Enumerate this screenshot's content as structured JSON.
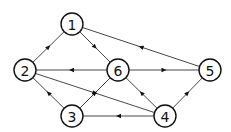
{
  "diagram": {
    "type": "directed-graph",
    "nodes": [
      {
        "id": "1",
        "label": "1",
        "x": 72,
        "y": 24
      },
      {
        "id": "2",
        "label": "2",
        "x": 25,
        "y": 70
      },
      {
        "id": "6",
        "label": "6",
        "x": 118,
        "y": 70
      },
      {
        "id": "5",
        "label": "5",
        "x": 210,
        "y": 70
      },
      {
        "id": "3",
        "label": "3",
        "x": 72,
        "y": 116
      },
      {
        "id": "4",
        "label": "4",
        "x": 165,
        "y": 116
      }
    ],
    "edges": [
      {
        "from": "2",
        "to": "1"
      },
      {
        "from": "1",
        "to": "6"
      },
      {
        "from": "5",
        "to": "1"
      },
      {
        "from": "6",
        "to": "2"
      },
      {
        "from": "6",
        "to": "5"
      },
      {
        "from": "3",
        "to": "2"
      },
      {
        "from": "3",
        "to": "6"
      },
      {
        "from": "2",
        "to": "4"
      },
      {
        "from": "4",
        "to": "6"
      },
      {
        "from": "4",
        "to": "5"
      },
      {
        "from": "4",
        "to": "3"
      }
    ],
    "node_radius": 11,
    "colors": {
      "stroke": "#111111",
      "background": "#ffffff"
    }
  }
}
